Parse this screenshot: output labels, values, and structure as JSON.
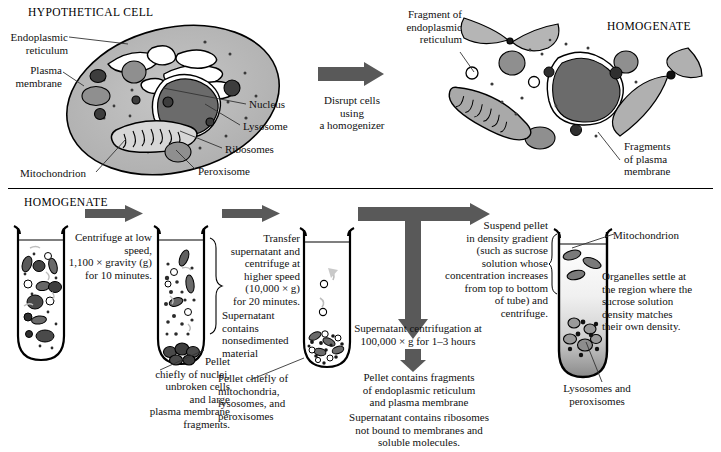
{
  "figure": {
    "title_top_left": "HYPOTHETICAL CELL",
    "title_top_right": "HOMOGENATE",
    "title_bottom_left": "HOMOGENATE"
  },
  "cell_labels": {
    "endoplasmic_reticulum": "Endoplasmic\nreticulum",
    "endoplasmic_reticulum_l1": "Endoplasmic",
    "endoplasmic_reticulum_l2": "reticulum",
    "plasma_membrane_l1": "Plasma",
    "plasma_membrane_l2": "membrane",
    "mitochondrion": "Mitochondrion",
    "peroxisome": "Peroxisome",
    "nucleus": "Nucleus",
    "lysosome": "Lysosome",
    "ribosomes": "Ribosomes"
  },
  "disrupt_step": {
    "line1": "Disrupt cells using",
    "line2": "a homogenizer"
  },
  "homogenate_labels": {
    "fragment_er_l1": "Fragment of",
    "fragment_er_l2": "endoplasmic",
    "fragment_er_l3": "reticulum",
    "fragments_pm_l1": "Fragments",
    "fragments_pm_l2": "of plasma",
    "fragments_pm_l3": "membrane"
  },
  "step1": {
    "l1": "Centrifuge at low",
    "l2": "speed,",
    "l3": "1,100 × gravity (g)",
    "l4": "for 10 minutes."
  },
  "step1_pellet": {
    "l1": "Pellet",
    "l2": "chiefly of nuclei,",
    "l3": "unbroken cells",
    "l4": "and large",
    "l5": "plasma membrane",
    "l6": "fragments."
  },
  "step2": {
    "l1": "Transfer",
    "l2": "supernatant and",
    "l3": "centrifuge at",
    "l4": "higher speed",
    "l5": "(10,000 × g)",
    "l6": "for 20 minutes."
  },
  "step2_supernatant": {
    "l1": "Supernatant",
    "l2": "contains",
    "l3": "nonsedimented",
    "l4": "material"
  },
  "step2_pellet": {
    "l1": "Pellet chiefly of",
    "l2": "mitochondria,",
    "l3": "lysosomes, and",
    "l4": "peroxisomes"
  },
  "step3": {
    "l1": "Supernatant centrifugation at",
    "l2": "100,000 × g for 1–3 hours"
  },
  "step3_results": {
    "pellet_l1": "Pellet contains fragments",
    "pellet_l2": "of endoplasmic reticulum",
    "pellet_l3": "and plasma membrane",
    "sup_l1": "Supernatant contains ribosomes",
    "sup_l2": "not bound to membranes and",
    "sup_l3": "soluble molecules."
  },
  "step4": {
    "l1": "Suspend pellet",
    "l2": "in density gradient",
    "l3": "(such as sucrose",
    "l4": "solution whose",
    "l5": "concentration increases",
    "l6": "from top to bottom",
    "l7": "of tube) and",
    "l8": "centrifuge."
  },
  "gradient_labels": {
    "mitochondrion": "Mitochondrion",
    "organelles_l1": "Organelles settle at",
    "organelles_l2": "the region where the",
    "organelles_l3": "sucrose solution",
    "organelles_l4": "density matches",
    "organelles_l5": "their own density.",
    "lyso_l1": "Lysosomes and",
    "lyso_l2": "peroxisomes"
  },
  "colors": {
    "arrow_gray": "#595959",
    "cytoplasm": "#b9b9b9",
    "nucleus": "#6b6b6b",
    "organelle_dark": "#3a3a3a",
    "organelle_mid": "#8a8a8a",
    "outline": "#000000",
    "text": "#111111"
  },
  "icon_names": {
    "block_arrow_right": "block-arrow-right-icon",
    "block_arrow_down": "block-arrow-down-icon",
    "test_tube": "test-tube-icon",
    "cell": "cell-diagram-icon"
  }
}
